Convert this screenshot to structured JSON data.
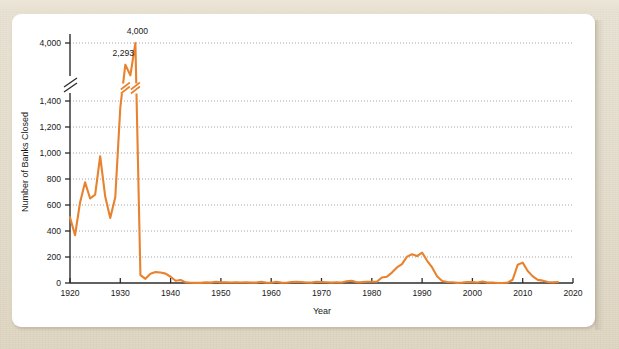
{
  "figure": {
    "caption_sliver": "",
    "card_background": "#ffffff",
    "page_background": "#e6dfcf"
  },
  "chart_data": {
    "type": "line",
    "title": "",
    "subtitle": "",
    "xlabel": "Year",
    "ylabel": "Number of Banks Closed",
    "line_color": "#E8822E",
    "grid": true,
    "grid_axis": "y",
    "legend": null,
    "xlim": [
      1920,
      2020
    ],
    "ylim": [
      0,
      4000
    ],
    "x_ticks": [
      1920,
      1930,
      1940,
      1950,
      1960,
      1970,
      1980,
      1990,
      2000,
      2010,
      2020
    ],
    "x_tick_labels": [
      "1920",
      "1930",
      "1940",
      "1950",
      "1960",
      "1970",
      "1980",
      "1990",
      "2000",
      "2010",
      "2020"
    ],
    "y_ticks": [
      0,
      200,
      400,
      600,
      800,
      1000,
      1200,
      1400,
      4000
    ],
    "y_tick_labels": [
      "0",
      "200",
      "400",
      "600",
      "800",
      "1,000",
      "1,200",
      "1,400",
      "4,000"
    ],
    "axis_break": {
      "present": true,
      "between": [
        1400,
        4000
      ],
      "note": "broken y-axis: compressed region between 1,400 and 4,000"
    },
    "annotations": [
      {
        "text": "4,000",
        "x": 1933,
        "y": 4000
      },
      {
        "text": "2,293",
        "x": 1931,
        "y": 2293
      }
    ],
    "x": [
      1920,
      1921,
      1922,
      1923,
      1924,
      1925,
      1926,
      1927,
      1928,
      1929,
      1930,
      1931,
      1932,
      1933,
      1934,
      1935,
      1936,
      1937,
      1938,
      1939,
      1940,
      1941,
      1942,
      1943,
      1944,
      1945,
      1946,
      1947,
      1948,
      1949,
      1950,
      1951,
      1952,
      1953,
      1954,
      1955,
      1956,
      1957,
      1958,
      1959,
      1960,
      1961,
      1962,
      1963,
      1964,
      1965,
      1966,
      1967,
      1968,
      1969,
      1970,
      1971,
      1972,
      1973,
      1974,
      1975,
      1976,
      1977,
      1978,
      1979,
      1980,
      1981,
      1982,
      1983,
      1984,
      1985,
      1986,
      1987,
      1988,
      1989,
      1990,
      1991,
      1992,
      1993,
      1994,
      1995,
      1996,
      1997,
      1998,
      1999,
      2000,
      2001,
      2002,
      2003,
      2004,
      2005,
      2006,
      2007,
      2008,
      2009,
      2010,
      2011,
      2012,
      2013,
      2014,
      2015,
      2016,
      2017
    ],
    "values": [
      505,
      367,
      620,
      775,
      650,
      680,
      975,
      665,
      500,
      660,
      1350,
      2293,
      1453,
      4000,
      61,
      32,
      72,
      84,
      81,
      72,
      48,
      17,
      23,
      5,
      2,
      1,
      1,
      5,
      3,
      9,
      5,
      5,
      4,
      5,
      4,
      5,
      3,
      3,
      9,
      3,
      2,
      9,
      3,
      2,
      8,
      9,
      8,
      4,
      3,
      9,
      8,
      6,
      3,
      6,
      4,
      14,
      17,
      6,
      7,
      10,
      10,
      10,
      42,
      48,
      80,
      120,
      145,
      203,
      221,
      207,
      234,
      171,
      120,
      50,
      15,
      8,
      6,
      1,
      3,
      8,
      7,
      4,
      11,
      3,
      4,
      0,
      0,
      3,
      25,
      140,
      157,
      92,
      51,
      24,
      18,
      8,
      5,
      8
    ]
  },
  "axes": {
    "y_axis_title": "Number of Banks Closed",
    "x_axis_title": "Year"
  }
}
